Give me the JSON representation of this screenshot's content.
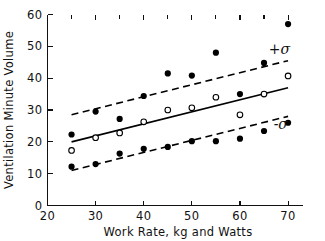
{
  "chart_data": {
    "type": "scatter",
    "title": "",
    "xlabel": "Work Rate, kg and Watts",
    "ylabel": "Ventilation Minute Volume",
    "xlim": [
      20,
      73
    ],
    "ylim": [
      0,
      60
    ],
    "xticks": [
      20,
      30,
      40,
      50,
      60,
      70
    ],
    "yticks": [
      0,
      10,
      20,
      30,
      40,
      50,
      60
    ],
    "grid": false,
    "legend_position": "none",
    "annotations": [
      {
        "text": "+σ",
        "x": 66,
        "y": 47.5,
        "name": "plus-sigma-label"
      },
      {
        "text": "-σ",
        "x": 67,
        "y": 24.0,
        "name": "minus-sigma-label"
      }
    ],
    "lines": [
      {
        "name": "regression-line",
        "style": "solid",
        "x": [
          25,
          70
        ],
        "y": [
          20.0,
          37.0
        ]
      },
      {
        "name": "plus-sigma-line",
        "style": "dashed",
        "x": [
          25,
          70
        ],
        "y": [
          28.5,
          45.5
        ]
      },
      {
        "name": "minus-sigma-line",
        "style": "dashed",
        "x": [
          25,
          70
        ],
        "y": [
          11.0,
          28.0
        ]
      }
    ],
    "series": [
      {
        "name": "Open circles",
        "marker": "open-circle",
        "x": [
          25,
          30,
          35,
          40,
          45,
          50,
          55,
          60,
          65,
          70
        ],
        "y": [
          17.3,
          21.3,
          22.8,
          26.3,
          30.0,
          30.7,
          34.0,
          28.5,
          35.0,
          40.7
        ]
      },
      {
        "name": "Filled circles upper",
        "marker": "filled-circle",
        "x": [
          25,
          30,
          35,
          40,
          45,
          50,
          55,
          60,
          65,
          70
        ],
        "y": [
          22.3,
          29.5,
          27.2,
          34.4,
          41.5,
          40.8,
          48.0,
          35.0,
          44.8,
          57.0
        ]
      },
      {
        "name": "Filled circles lower",
        "marker": "filled-circle",
        "x": [
          25,
          30,
          35,
          40,
          45,
          50,
          55,
          60,
          65,
          70
        ],
        "y": [
          12.2,
          13.0,
          16.3,
          17.8,
          18.4,
          20.2,
          20.2,
          21.0,
          23.4,
          26.0
        ]
      }
    ]
  },
  "colors": {
    "ink": "#111111",
    "background": "#ffffff",
    "marker_fill": "#000000",
    "marker_open_fill": "#ffffff"
  }
}
